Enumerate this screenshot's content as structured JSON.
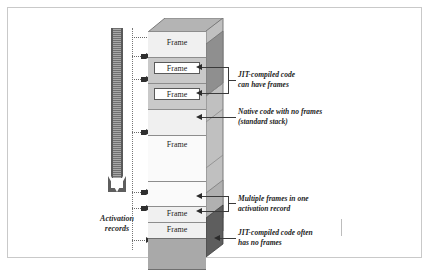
{
  "figure": {
    "arrow": {
      "label_line1": "Activation",
      "label_line2": "records",
      "direction": "down",
      "meaning": "stack grows downward"
    },
    "stack": {
      "frame_label": "Frame",
      "segments": [
        {
          "id": "seg-1",
          "kind": "light",
          "frame": "Frame"
        },
        {
          "id": "seg-2",
          "kind": "mid",
          "frame": "Frame"
        },
        {
          "id": "seg-3",
          "kind": "mid",
          "frame": "Frame"
        },
        {
          "id": "seg-4",
          "kind": "light",
          "frame": ""
        },
        {
          "id": "seg-5",
          "kind": "lighter",
          "frame": "Frame"
        },
        {
          "id": "seg-6",
          "kind": "lighter",
          "frame": ""
        },
        {
          "id": "seg-7",
          "kind": "light",
          "frame": "Frame"
        },
        {
          "id": "seg-8",
          "kind": "light",
          "frame": "Frame"
        },
        {
          "id": "seg-9",
          "kind": "dark",
          "frame": ""
        }
      ]
    },
    "callouts": [
      {
        "id": "callout-jit-can-have-frames",
        "text": "JIT-compiled code\ncan have frames",
        "targets": 2
      },
      {
        "id": "callout-native-no-frames",
        "text": "Native code with no frames\n(standard stack)",
        "targets": 1
      },
      {
        "id": "callout-multiple-frames",
        "text": "Multiple frames in one\nactivation record",
        "targets": 2
      },
      {
        "id": "callout-jit-often-no-frames",
        "text": "JIT-compiled code often\nhas no frames",
        "targets": 1
      }
    ],
    "colors": {
      "border": "#c9c9c9",
      "front_light": "#f0f0f0",
      "front_lighter": "#fafafa",
      "front_mid": "#c9c9c9",
      "front_dark": "#a9a9a9",
      "side_light": "#d6d6d6",
      "side_mid": "#9d9d9d",
      "side_dark": "#6e6e6e",
      "arrow": "#5e5e5e",
      "text": "#1c1c1c"
    }
  }
}
